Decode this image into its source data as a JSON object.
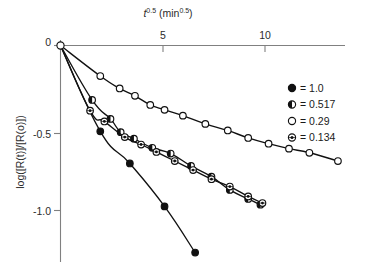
{
  "chart_data": {
    "type": "scatter",
    "title": "",
    "xlabel": "t^0.5 (min^0.5)",
    "xlabel_parts": {
      "base": "t",
      "exp": "0.5",
      "unit_open": " (min",
      "unit_exp": "0.5",
      "unit_close": ")"
    },
    "ylabel": "log([R(t)]/[R(o)])",
    "xlim": [
      0,
      14
    ],
    "ylim": [
      -1.45,
      0.05
    ],
    "xticks": [
      5,
      10
    ],
    "xtick_labels": [
      "5",
      "10"
    ],
    "yticks": [
      0,
      -0.5,
      -1.0
    ],
    "ytick_labels": [
      "0",
      "-0.5",
      "-1.0"
    ],
    "grid": false,
    "legend_position": "right",
    "series": [
      {
        "name": "1.0",
        "label": "= 1.0",
        "marker": "filled-circle",
        "points": [
          {
            "x": 0.0,
            "y": 0.0
          },
          {
            "x": 1.95,
            "y": -0.52
          },
          {
            "x": 3.4,
            "y": -0.715
          },
          {
            "x": 5.1,
            "y": -0.975
          },
          {
            "x": 6.6,
            "y": -1.255
          }
        ]
      },
      {
        "name": "0.517",
        "label": "= 0.517",
        "marker": "half-filled-circle",
        "points": [
          {
            "x": 0.0,
            "y": 0.0
          },
          {
            "x": 1.55,
            "y": -0.33
          },
          {
            "x": 2.45,
            "y": -0.445
          },
          {
            "x": 2.95,
            "y": -0.525
          },
          {
            "x": 3.6,
            "y": -0.565
          },
          {
            "x": 4.5,
            "y": -0.62
          },
          {
            "x": 5.4,
            "y": -0.655
          },
          {
            "x": 6.4,
            "y": -0.73
          },
          {
            "x": 7.4,
            "y": -0.795
          },
          {
            "x": 8.3,
            "y": -0.875
          },
          {
            "x": 9.2,
            "y": -0.93
          },
          {
            "x": 9.8,
            "y": -0.965
          }
        ]
      },
      {
        "name": "0.29",
        "label": "= 0.29",
        "marker": "open-circle",
        "points": [
          {
            "x": 0.0,
            "y": 0.0
          },
          {
            "x": 1.95,
            "y": -0.185
          },
          {
            "x": 2.9,
            "y": -0.26
          },
          {
            "x": 3.65,
            "y": -0.305
          },
          {
            "x": 4.4,
            "y": -0.36
          },
          {
            "x": 5.1,
            "y": -0.39
          },
          {
            "x": 6.0,
            "y": -0.425
          },
          {
            "x": 7.1,
            "y": -0.475
          },
          {
            "x": 8.2,
            "y": -0.515
          },
          {
            "x": 9.2,
            "y": -0.56
          },
          {
            "x": 10.2,
            "y": -0.595
          },
          {
            "x": 11.2,
            "y": -0.625
          },
          {
            "x": 12.2,
            "y": -0.65
          },
          {
            "x": 13.6,
            "y": -0.7
          }
        ]
      },
      {
        "name": "0.134",
        "label": "= 0.134",
        "marker": "dotted-circle",
        "points": [
          {
            "x": 0.0,
            "y": 0.0
          },
          {
            "x": 1.45,
            "y": -0.395
          },
          {
            "x": 2.15,
            "y": -0.46
          },
          {
            "x": 3.15,
            "y": -0.555
          },
          {
            "x": 3.95,
            "y": -0.6
          },
          {
            "x": 4.7,
            "y": -0.645
          },
          {
            "x": 5.6,
            "y": -0.7
          },
          {
            "x": 6.5,
            "y": -0.755
          },
          {
            "x": 7.4,
            "y": -0.81
          },
          {
            "x": 8.3,
            "y": -0.855
          },
          {
            "x": 9.2,
            "y": -0.915
          },
          {
            "x": 9.9,
            "y": -0.955
          }
        ]
      }
    ]
  },
  "legend": {
    "entries": [
      {
        "marker": "filled-circle",
        "label": "= 1.0"
      },
      {
        "marker": "half-filled-circle",
        "label": "= 0.517"
      },
      {
        "marker": "open-circle",
        "label": "= 0.29"
      },
      {
        "marker": "dotted-circle",
        "label": "= 0.134"
      }
    ]
  },
  "axes": {
    "x_title_base": "t",
    "x_title_exp": "0.5",
    "x_title_unit_open": " (min",
    "x_title_unit_exp": "0.5",
    "x_title_unit_close": ")",
    "y_title": "log([R(t)]/[R(o)])",
    "xtick_0": "5",
    "xtick_1": "10",
    "ytick_0": "0",
    "ytick_1": "-0.5",
    "ytick_2": "-1.0"
  }
}
